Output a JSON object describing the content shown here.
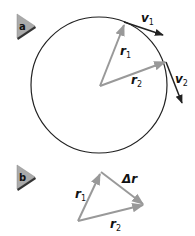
{
  "figure": {
    "panels": [
      {
        "id": "a",
        "badge": "a",
        "circle": {
          "cx": 99,
          "cy": 85,
          "r": 68,
          "stroke": "#222222"
        },
        "radius_vectors": [
          {
            "label": "r",
            "subscript": "1",
            "from": [
              100,
              86
            ],
            "to": [
              124,
              24
            ],
            "color": "#999999"
          },
          {
            "label": "r",
            "subscript": "2",
            "from": [
              100,
              86
            ],
            "to": [
              166,
              62
            ],
            "color": "#999999"
          }
        ],
        "velocity_vectors": [
          {
            "label": "v",
            "subscript": "1",
            "from": [
              124,
              22
            ],
            "to": [
              163,
              35
            ],
            "color": "#222222"
          },
          {
            "label": "v",
            "subscript": "2",
            "from": [
              166,
              62
            ],
            "to": [
              182,
              103
            ],
            "color": "#222222"
          }
        ]
      },
      {
        "id": "b",
        "badge": "b",
        "vectors": [
          {
            "label": "r",
            "subscript": "1",
            "from": [
              78,
              221
            ],
            "to": [
              101,
              172
            ],
            "color": "#999999"
          },
          {
            "label": "r",
            "subscript": "2",
            "from": [
              78,
              221
            ],
            "to": [
              144,
              205
            ],
            "color": "#999999"
          },
          {
            "label": "Δr",
            "subscript": "",
            "from": [
              101,
              172
            ],
            "to": [
              144,
              205
            ],
            "color": "#999999"
          }
        ]
      }
    ],
    "labels": {
      "a_badge": "a",
      "b_badge": "b",
      "v1": "v",
      "v1_sub": "1",
      "v2": "v",
      "v2_sub": "2",
      "r1_a": "r",
      "r1_a_sub": "1",
      "r2_a": "r",
      "r2_a_sub": "2",
      "r1_b": "r",
      "r1_b_sub": "1",
      "r2_b": "r",
      "r2_b_sub": "2",
      "delta_r": "Δr"
    },
    "colors": {
      "radius_vector": "#999999",
      "velocity_vector": "#222222",
      "circle": "#222222",
      "badge_fill": "#aaaaaa",
      "badge_shadow": "#333333"
    }
  }
}
